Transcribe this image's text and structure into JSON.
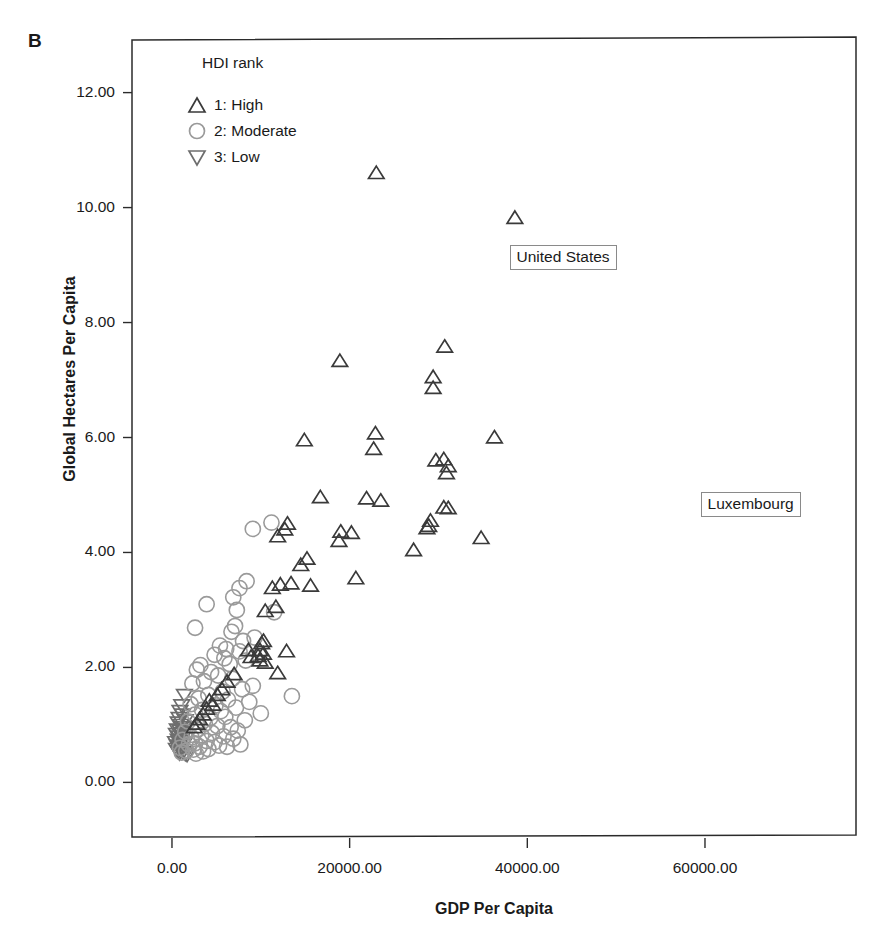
{
  "figure": {
    "panel_label": "B"
  },
  "legend": {
    "title": "HDI rank",
    "position": "inside-top-left",
    "items": [
      {
        "marker": "triangle-up",
        "label": "1: High",
        "color": "#3a3a3a"
      },
      {
        "marker": "circle",
        "label": "2: Moderate",
        "color": "#9a9a9a"
      },
      {
        "marker": "triangle-down",
        "label": "3: Low",
        "color": "#6e6e6e"
      }
    ]
  },
  "annotations": [
    {
      "text": "United States",
      "x": 38000,
      "y": 9.35,
      "box": true
    },
    {
      "text": "Luxembourg",
      "x": 59500,
      "y": 5.05,
      "box": true
    }
  ],
  "chart_data": {
    "type": "scatter",
    "title": "",
    "xlabel": "GDP Per Capita",
    "ylabel": "Global Hectares Per Capita",
    "xlim": [
      -4500,
      77000
    ],
    "ylim": [
      -0.95,
      12.95
    ],
    "xticks": [
      0,
      20000,
      40000,
      60000
    ],
    "xticklabels": [
      "0.00",
      "20000.00",
      "40000.00",
      "60000.00"
    ],
    "yticks": [
      0,
      2,
      4,
      6,
      8,
      10,
      12
    ],
    "yticklabels": [
      "0.00",
      "2.00",
      "4.00",
      "6.00",
      "8.00",
      "10.00",
      "12.00"
    ],
    "grid": false,
    "legend_title": "HDI rank",
    "series": [
      {
        "name": "1: High",
        "marker": "triangle-up",
        "color": "#3a3a3a",
        "points": [
          [
            23000,
            10.6
          ],
          [
            38600,
            9.82
          ],
          [
            30700,
            7.58
          ],
          [
            18900,
            7.33
          ],
          [
            29400,
            7.05
          ],
          [
            29400,
            6.86
          ],
          [
            22900,
            6.07
          ],
          [
            14900,
            5.95
          ],
          [
            36300,
            6.0
          ],
          [
            22700,
            5.8
          ],
          [
            30600,
            5.62
          ],
          [
            29700,
            5.6
          ],
          [
            31100,
            5.5
          ],
          [
            30900,
            5.38
          ],
          [
            16700,
            4.96
          ],
          [
            21900,
            4.94
          ],
          [
            23500,
            4.9
          ],
          [
            30600,
            4.78
          ],
          [
            31100,
            4.77
          ],
          [
            29100,
            4.55
          ],
          [
            28900,
            4.46
          ],
          [
            28700,
            4.42
          ],
          [
            13000,
            4.5
          ],
          [
            12700,
            4.4
          ],
          [
            11900,
            4.28
          ],
          [
            19000,
            4.36
          ],
          [
            20200,
            4.34
          ],
          [
            18800,
            4.2
          ],
          [
            34800,
            4.25
          ],
          [
            27200,
            4.04
          ],
          [
            15200,
            3.89
          ],
          [
            14500,
            3.78
          ],
          [
            20700,
            3.55
          ],
          [
            12200,
            3.44
          ],
          [
            13400,
            3.46
          ],
          [
            15600,
            3.42
          ],
          [
            11300,
            3.38
          ],
          [
            11700,
            3.05
          ],
          [
            10500,
            2.98
          ],
          [
            10300,
            2.46
          ],
          [
            10100,
            2.42
          ],
          [
            9900,
            2.3
          ],
          [
            12900,
            2.28
          ],
          [
            10300,
            2.24
          ],
          [
            9700,
            2.2
          ],
          [
            9900,
            2.12
          ],
          [
            10500,
            2.08
          ],
          [
            11900,
            1.9
          ],
          [
            8600,
            2.3
          ],
          [
            8900,
            2.18
          ],
          [
            4200,
            1.42
          ],
          [
            4600,
            1.35
          ],
          [
            3900,
            1.28
          ],
          [
            3500,
            1.18
          ],
          [
            3100,
            1.1
          ],
          [
            2800,
            1.02
          ],
          [
            2500,
            0.96
          ],
          [
            5100,
            1.52
          ],
          [
            5600,
            1.62
          ],
          [
            6200,
            1.75
          ],
          [
            7000,
            1.88
          ]
        ]
      },
      {
        "name": "2: Moderate",
        "marker": "circle",
        "color": "#9a9a9a",
        "points": [
          [
            9100,
            4.41
          ],
          [
            11200,
            4.52
          ],
          [
            8400,
            3.5
          ],
          [
            7600,
            3.38
          ],
          [
            6900,
            3.22
          ],
          [
            3900,
            3.1
          ],
          [
            7300,
            3.0
          ],
          [
            11500,
            2.96
          ],
          [
            2600,
            2.69
          ],
          [
            7100,
            2.72
          ],
          [
            6700,
            2.62
          ],
          [
            9300,
            2.52
          ],
          [
            8000,
            2.46
          ],
          [
            5400,
            2.38
          ],
          [
            6100,
            2.32
          ],
          [
            7600,
            2.28
          ],
          [
            4800,
            2.22
          ],
          [
            5900,
            2.16
          ],
          [
            8300,
            2.12
          ],
          [
            6500,
            2.06
          ],
          [
            3200,
            2.04
          ],
          [
            2800,
            1.96
          ],
          [
            4400,
            1.92
          ],
          [
            5200,
            1.86
          ],
          [
            6800,
            1.8
          ],
          [
            3600,
            1.76
          ],
          [
            2300,
            1.72
          ],
          [
            9100,
            1.68
          ],
          [
            7900,
            1.62
          ],
          [
            5700,
            1.58
          ],
          [
            13500,
            1.5
          ],
          [
            4100,
            1.52
          ],
          [
            3000,
            1.46
          ],
          [
            6300,
            1.44
          ],
          [
            8700,
            1.4
          ],
          [
            2100,
            1.36
          ],
          [
            4900,
            1.34
          ],
          [
            7200,
            1.3
          ],
          [
            3400,
            1.26
          ],
          [
            5500,
            1.24
          ],
          [
            10000,
            1.2
          ],
          [
            2600,
            1.18
          ],
          [
            6000,
            1.14
          ],
          [
            4300,
            1.12
          ],
          [
            8200,
            1.08
          ],
          [
            1800,
            1.06
          ],
          [
            3700,
            1.02
          ],
          [
            5100,
            0.98
          ],
          [
            6600,
            0.96
          ],
          [
            2900,
            0.92
          ],
          [
            7400,
            0.9
          ],
          [
            1500,
            0.88
          ],
          [
            4500,
            0.86
          ],
          [
            3300,
            0.82
          ],
          [
            5800,
            0.8
          ],
          [
            2200,
            0.78
          ],
          [
            6900,
            0.76
          ],
          [
            1200,
            0.74
          ],
          [
            3900,
            0.72
          ],
          [
            4800,
            0.7
          ],
          [
            2600,
            0.68
          ],
          [
            1900,
            0.66
          ],
          [
            5300,
            0.64
          ],
          [
            3100,
            0.62
          ],
          [
            900,
            0.6
          ],
          [
            4100,
            0.58
          ],
          [
            2400,
            0.57
          ],
          [
            1600,
            0.55
          ],
          [
            3500,
            0.54
          ],
          [
            6200,
            0.62
          ],
          [
            7700,
            0.66
          ],
          [
            1100,
            0.52
          ],
          [
            2700,
            0.5
          ]
        ]
      },
      {
        "name": "3: Low",
        "marker": "triangle-down",
        "color": "#6e6e6e",
        "points": [
          [
            1400,
            1.52
          ],
          [
            1100,
            1.34
          ],
          [
            900,
            1.24
          ],
          [
            1200,
            1.18
          ],
          [
            800,
            1.12
          ],
          [
            1500,
            1.08
          ],
          [
            700,
            1.04
          ],
          [
            1000,
            1.0
          ],
          [
            1300,
            0.96
          ],
          [
            600,
            0.92
          ],
          [
            900,
            0.9
          ],
          [
            1100,
            0.86
          ],
          [
            500,
            0.84
          ],
          [
            800,
            0.8
          ],
          [
            1200,
            0.78
          ],
          [
            700,
            0.74
          ],
          [
            1000,
            0.72
          ],
          [
            400,
            0.7
          ],
          [
            900,
            0.68
          ],
          [
            1300,
            0.66
          ],
          [
            600,
            0.64
          ],
          [
            800,
            0.62
          ],
          [
            1100,
            0.6
          ],
          [
            500,
            0.58
          ],
          [
            950,
            0.56
          ],
          [
            700,
            0.54
          ],
          [
            1250,
            0.53
          ],
          [
            850,
            0.51
          ],
          [
            1500,
            0.5
          ],
          [
            1700,
            0.48
          ]
        ]
      }
    ]
  }
}
